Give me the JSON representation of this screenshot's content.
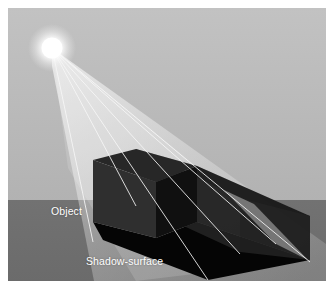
{
  "figure": {
    "labels": [
      {
        "id": "object",
        "text": "Object",
        "x": 43,
        "y": 197
      },
      {
        "id": "shadow-surface",
        "text": "Shadow-surface",
        "x": 78,
        "y": 247
      }
    ]
  },
  "scene": {
    "width": 318,
    "height": 273,
    "sky_color": "#b9b9b9",
    "ground_color": "#6f6f6f",
    "horizon_y": 192,
    "light": {
      "name": "light-source",
      "x": 44,
      "y": 40,
      "radius": 13,
      "core_color": "#ffffff",
      "glow_color": "#f2f2f2"
    },
    "object_box": {
      "name": "object-box",
      "top_face_color": "#272727",
      "left_face_color": "#2e2e2e",
      "right_face_color": "#101010",
      "top_face": "85,152 128,141 189,158 148,174",
      "left_face": "85,152 148,174 148,230 85,214",
      "right_face": "148,174 189,158 189,214 148,230"
    },
    "shadow_volume": {
      "name": "shadow-volume",
      "fill_color": "#9c9c9c",
      "opacity": 0.55,
      "faces": [
        {
          "name": "volume-top-face",
          "points": "128,141 189,158 302,208 232,190",
          "color": "#8d8d8d",
          "opacity": 0.6
        },
        {
          "name": "volume-side-face",
          "points": "189,158 302,208 302,252 189,214",
          "color": "#151515",
          "opacity": 0.9
        },
        {
          "name": "volume-front-face",
          "points": "128,141 232,190 232,244 128,196",
          "color": "#303030",
          "opacity": 0.75
        }
      ]
    },
    "ground_shadow": {
      "name": "ground-shadow",
      "color": "#050505",
      "points": "85,214 148,230 189,214 302,252 200,272 95,232"
    },
    "light_rays": {
      "name": "light-rays",
      "color": "#f4f4f4",
      "cone_opacity": 0.45,
      "ray_opacity": 0.95,
      "rays": [
        {
          "x2": 85,
          "y2": 232
        },
        {
          "x2": 128,
          "y2": 196
        },
        {
          "x2": 200,
          "y2": 272
        },
        {
          "x2": 232,
          "y2": 244
        },
        {
          "x2": 268,
          "y2": 234
        },
        {
          "x2": 302,
          "y2": 252
        }
      ]
    }
  }
}
